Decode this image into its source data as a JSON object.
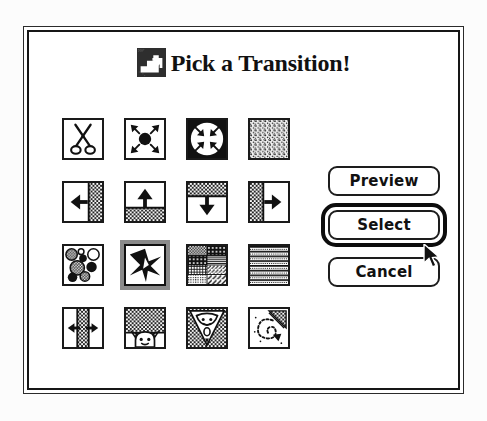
{
  "window": {
    "kind": "modal-dialog",
    "background_color": "#ffffff",
    "frame_color": "#161616",
    "page_background": "#fcfcfc"
  },
  "title": {
    "text": "Pick a Transition!",
    "icon_name": "transition-staircase-arrow-icon",
    "icon_colors": {
      "fill": "#2e2e2e",
      "glyph": "#ffffff"
    }
  },
  "grid": {
    "columns": 4,
    "rows": 4,
    "selected_index": 9,
    "items": [
      {
        "index": 0,
        "name": "cut",
        "label": "Cut",
        "icon_name": "scissors-icon"
      },
      {
        "index": 1,
        "name": "iris-open",
        "label": "Iris Open",
        "icon_name": "iris-open-icon"
      },
      {
        "index": 2,
        "name": "iris-close",
        "label": "Iris Close",
        "icon_name": "iris-close-icon"
      },
      {
        "index": 3,
        "name": "dissolve",
        "label": "Dissolve",
        "icon_name": "dissolve-speckle-icon"
      },
      {
        "index": 4,
        "name": "wipe-left",
        "label": "Wipe Left",
        "icon_name": "wipe-left-icon"
      },
      {
        "index": 5,
        "name": "wipe-up",
        "label": "Wipe Up",
        "icon_name": "wipe-up-icon"
      },
      {
        "index": 6,
        "name": "wipe-down",
        "label": "Wipe Down",
        "icon_name": "wipe-down-icon"
      },
      {
        "index": 7,
        "name": "wipe-right",
        "label": "Wipe Right",
        "icon_name": "wipe-right-icon"
      },
      {
        "index": 8,
        "name": "bubbles",
        "label": "Bubbles",
        "icon_name": "bubbles-icon"
      },
      {
        "index": 9,
        "name": "star-burst",
        "label": "Star Burst",
        "icon_name": "star-burst-icon"
      },
      {
        "index": 10,
        "name": "patterns",
        "label": "Patterns",
        "icon_name": "pattern-tiles-icon"
      },
      {
        "index": 11,
        "name": "venetian-blinds",
        "label": "Venetian Blinds",
        "icon_name": "horizontal-blinds-icon"
      },
      {
        "index": 12,
        "name": "split-open",
        "label": "Split Open",
        "icon_name": "split-open-icon"
      },
      {
        "index": 13,
        "name": "curtain-up",
        "label": "Curtain Up",
        "icon_name": "curtain-up-face-icon"
      },
      {
        "index": 14,
        "name": "zoom-cone",
        "label": "Zoom",
        "icon_name": "zoom-cone-face-icon"
      },
      {
        "index": 15,
        "name": "spiral",
        "label": "Spiral",
        "icon_name": "spiral-swirl-icon"
      }
    ]
  },
  "buttons": {
    "preview": {
      "label": "Preview",
      "default": false
    },
    "select": {
      "label": "Select",
      "default": true
    },
    "cancel": {
      "label": "Cancel",
      "default": false
    }
  },
  "cursor": {
    "icon_name": "arrow-pointer-cursor",
    "over": "select-button",
    "x": 394,
    "y": 212
  }
}
